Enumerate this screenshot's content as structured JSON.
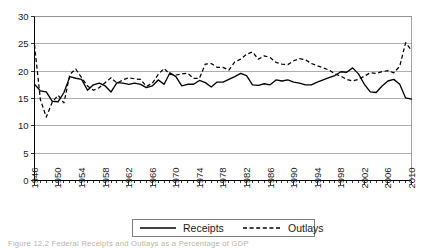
{
  "figure": {
    "caption": "Figure 12.2  Federal Receipts and Outlays as a Percentage of GDP"
  },
  "legend": {
    "receipts_label": "Receipts",
    "outlays_label": "Outlays"
  },
  "chart_data": {
    "type": "line",
    "title": "",
    "subtitle": "",
    "xlabel": "",
    "ylabel": "",
    "xlim": [
      1946,
      2010
    ],
    "ylim": [
      0,
      30
    ],
    "yticks": [
      0,
      5,
      10,
      15,
      20,
      25,
      30
    ],
    "xticks": [
      1946,
      1950,
      1954,
      1958,
      1962,
      1966,
      1970,
      1974,
      1978,
      1982,
      1986,
      1990,
      1994,
      1998,
      2002,
      2006,
      2010
    ],
    "grid": "horizontal",
    "legend_position": "below-plot",
    "x": [
      1946,
      1947,
      1948,
      1949,
      1950,
      1951,
      1952,
      1953,
      1954,
      1955,
      1956,
      1957,
      1958,
      1959,
      1960,
      1961,
      1962,
      1963,
      1964,
      1965,
      1966,
      1967,
      1968,
      1969,
      1970,
      1971,
      1972,
      1973,
      1974,
      1975,
      1976,
      1977,
      1978,
      1979,
      1980,
      1981,
      1982,
      1983,
      1984,
      1985,
      1986,
      1987,
      1988,
      1989,
      1990,
      1991,
      1992,
      1993,
      1994,
      1995,
      1996,
      1997,
      1998,
      1999,
      2000,
      2001,
      2002,
      2003,
      2004,
      2005,
      2006,
      2007,
      2008,
      2009,
      2010
    ],
    "series": [
      {
        "name": "Receipts",
        "style": "solid",
        "color": "#000000",
        "values": [
          17.6,
          16.4,
          16.2,
          14.5,
          14.4,
          16.1,
          19.0,
          18.7,
          18.5,
          16.5,
          17.5,
          17.8,
          17.3,
          16.2,
          17.9,
          17.8,
          17.6,
          17.8,
          17.6,
          17.0,
          17.3,
          18.4,
          17.6,
          19.7,
          19.0,
          17.3,
          17.6,
          17.6,
          18.3,
          17.9,
          17.1,
          18.0,
          18.0,
          18.5,
          19.0,
          19.6,
          19.2,
          17.5,
          17.4,
          17.7,
          17.5,
          18.4,
          18.2,
          18.4,
          18.0,
          17.8,
          17.5,
          17.5,
          18.0,
          18.4,
          18.8,
          19.2,
          19.9,
          19.8,
          20.6,
          19.5,
          17.6,
          16.2,
          16.1,
          17.3,
          18.2,
          18.5,
          17.6,
          15.1,
          14.9
        ]
      },
      {
        "name": "Outlays",
        "style": "dashed",
        "color": "#000000",
        "values": [
          24.8,
          14.8,
          11.6,
          14.3,
          15.6,
          14.2,
          19.4,
          20.4,
          18.8,
          17.3,
          16.5,
          17.0,
          17.9,
          18.8,
          17.8,
          18.4,
          18.8,
          18.6,
          18.5,
          17.2,
          17.8,
          19.4,
          20.5,
          19.4,
          19.3,
          19.5,
          19.6,
          18.7,
          18.7,
          21.3,
          21.4,
          20.7,
          20.7,
          20.2,
          21.7,
          22.2,
          23.1,
          23.5,
          22.2,
          22.8,
          22.5,
          21.6,
          21.3,
          21.2,
          21.9,
          22.3,
          22.1,
          21.4,
          21.0,
          20.6,
          20.2,
          19.5,
          19.1,
          18.5,
          18.2,
          18.5,
          19.1,
          19.7,
          19.6,
          19.9,
          20.1,
          19.7,
          20.9,
          25.2,
          23.8
        ]
      }
    ]
  }
}
